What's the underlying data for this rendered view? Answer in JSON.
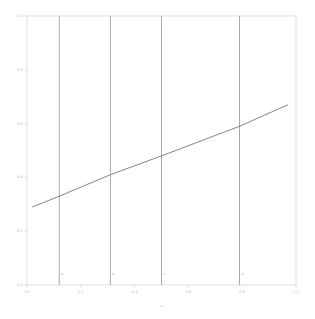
{
  "figure": {
    "width": 315,
    "height": 319,
    "background_color": "#ffffff",
    "name": "line-plot-with-vertical-reference-lines"
  },
  "colors": {
    "background": "#ffffff",
    "spine": "#d2d2d2",
    "tick_label": "#b9b9b9",
    "axis_title": "#bcbcbc",
    "data_line": "#6f6f6f",
    "vertical_line": "#8d8d8d",
    "vertical_line_label": "#a8a8a8"
  },
  "chart_data": {
    "type": "line",
    "title": "",
    "xlabel": "x",
    "ylabel": "",
    "xlim": [
      0.0,
      1.0
    ],
    "ylim": [
      0.0,
      1.0
    ],
    "grid": false,
    "legend": "none",
    "x_ticks": [
      0.0,
      0.2,
      0.4,
      0.6,
      0.8,
      1.0
    ],
    "x_tick_labels": [
      "0.0",
      "0.2",
      "0.4",
      "0.6",
      "0.8",
      "1.0"
    ],
    "y_ticks": [
      0.0,
      0.2,
      0.4,
      0.6,
      0.8,
      1.0
    ],
    "y_tick_labels": [
      "0.0",
      "0.2",
      "0.4",
      "0.6",
      "0.8",
      "1.0"
    ],
    "series": [
      {
        "name": "trend",
        "type": "line",
        "x": [
          0.02,
          0.12,
          0.31,
          0.5,
          0.79,
          0.97
        ],
        "values": [
          0.29,
          0.33,
          0.41,
          0.48,
          0.59,
          0.67
        ]
      }
    ],
    "vertical_lines": [
      {
        "x": 0.12,
        "label": "a"
      },
      {
        "x": 0.31,
        "label": "b"
      },
      {
        "x": 0.5,
        "label": "c"
      },
      {
        "x": 0.79,
        "label": "d"
      }
    ],
    "vertical_line_label_y": 0.04
  }
}
